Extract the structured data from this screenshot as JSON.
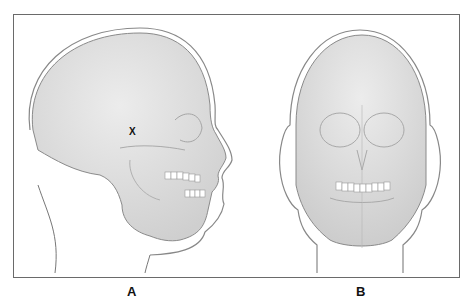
{
  "figure": {
    "panels": [
      {
        "label": "A",
        "view": "lateral-skull"
      },
      {
        "label": "B",
        "view": "frontal-skull"
      }
    ],
    "marker": "X"
  },
  "colors": {
    "frame": "#6a6a6a",
    "head_fill": "#d6d6d6",
    "skull_fill": "#e4e4e4",
    "outline": "#7a7a7a",
    "teeth": "#ffffff"
  }
}
